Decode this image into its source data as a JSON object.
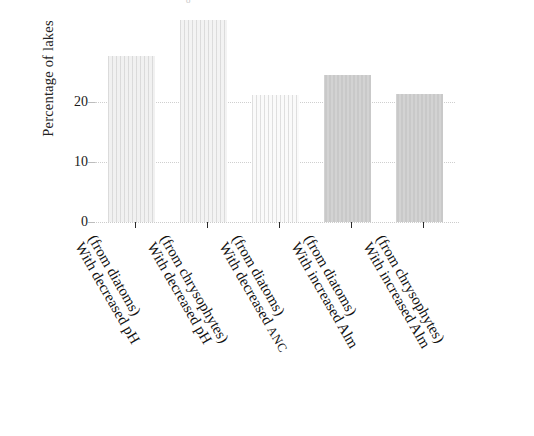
{
  "figure": {
    "top_partial_glyph": "ᵒ",
    "background_color": "#ffffff"
  },
  "axes": {
    "y_title": "Percentage of lakes",
    "y_ticks": [
      "0",
      "10",
      "20"
    ],
    "y_tick_values": [
      0,
      10,
      20
    ],
    "y_min": 0,
    "y_max": 35,
    "grid": "dotted horizontal gridlines at 10 and 20",
    "x_title": ""
  },
  "chart_data": {
    "type": "bar",
    "title": "",
    "xlabel": "",
    "ylabel": "Percentage of lakes",
    "ylim": [
      0,
      35
    ],
    "grid": true,
    "legend": "none",
    "categories": [
      "With decreased pH (from diatoms)",
      "With decreased pH (from chrysophytes)",
      "With decreased ANC (from diatoms)",
      "With increased Alm (from diatoms)",
      "With increased Alm (from chrysophytes)"
    ],
    "values": [
      27.6,
      33.7,
      21.2,
      24.5,
      21.3
    ],
    "colors": [
      "#f1f1f1",
      "#f3f3f3",
      "#fafafa",
      "#c9c9c9",
      "#c9c9c9"
    ]
  },
  "bars": [
    {
      "label_line1": "With decreased pH",
      "label_line2": "(from diatoms)",
      "value": 27.6,
      "color": "#f1f1f1",
      "style": "hatch"
    },
    {
      "label_line1": "With decreased pH",
      "label_line2": "(from chrysophytes)",
      "value": 33.7,
      "color": "#f3f3f3",
      "style": "hatch"
    },
    {
      "label_line1": "With decreased ANC",
      "label_line2": "(from diatoms)",
      "value": 21.2,
      "color": "#fafafa",
      "style": "hatch"
    },
    {
      "label_line1": "With increased Alm",
      "label_line2": "(from diatoms)",
      "value": 24.5,
      "color": "#c9c9c9",
      "style": "solidgray"
    },
    {
      "label_line1": "With increased Alm",
      "label_line2": "(from chrysophytes)",
      "value": 21.3,
      "color": "#c9c9c9",
      "style": "solidgray"
    }
  ]
}
